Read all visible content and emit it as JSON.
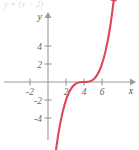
{
  "caption": {
    "text": "y =  (x − 2)",
    "note": "partially cropped caption fragment at top of figure"
  },
  "figure": {
    "name": "cubic-function-graph",
    "x_axis_label": "x",
    "y_axis_label": "y"
  },
  "chart_data": {
    "type": "line",
    "title": "",
    "subtitle": "",
    "xlabel": "x",
    "ylabel": "y",
    "xlim": [
      -3.2,
      7.4
    ],
    "ylim": [
      -5.6,
      6.2
    ],
    "xticks": [
      -2,
      2,
      4,
      6
    ],
    "xticklabels": [
      "-2",
      "2",
      "4",
      "6"
    ],
    "yticks": [
      4,
      2,
      -2,
      -4
    ],
    "yticklabels": [
      "4",
      "2",
      "-2",
      "-4"
    ],
    "grid": false,
    "legend": null,
    "series": [
      {
        "name": "y = (x - 2)^3",
        "color": "#e0455a",
        "arrow_start": true,
        "arrow_end": true,
        "x": [
          0.3,
          0.55,
          0.8,
          1.05,
          1.3,
          1.55,
          1.8,
          2.0,
          2.2,
          2.45,
          2.7,
          2.95,
          3.2,
          3.45,
          3.7
        ],
        "y": [
          -4.91,
          -3.04,
          -1.73,
          -0.86,
          -0.34,
          -0.09,
          -0.01,
          0.0,
          0.01,
          0.09,
          0.34,
          0.86,
          1.73,
          3.04,
          4.91
        ]
      }
    ],
    "annotations": [
      {
        "label": "inflection point",
        "x": 2,
        "y": 0
      }
    ]
  }
}
